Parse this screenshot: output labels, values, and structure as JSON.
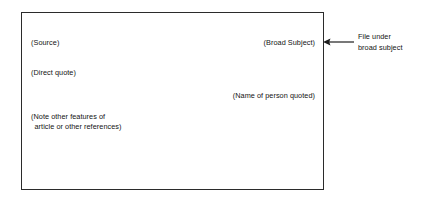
{
  "diagram": {
    "type": "annotated-note-card",
    "card": {
      "fields": {
        "source": "(Source)",
        "broad_subject": "(Broad Subject)",
        "direct_quote": "(Direct quote)",
        "person_quoted": "(Name of person quoted)",
        "note_other_line1": "(Note other features of",
        "note_other_line2": "article or other references)"
      }
    },
    "annotation": {
      "arrow_icon": "arrow-left-icon",
      "line1": "File under",
      "line2": "broad subject"
    },
    "colors": {
      "border": "#2b2b2b",
      "text": "#131313",
      "background": "#ffffff"
    }
  }
}
